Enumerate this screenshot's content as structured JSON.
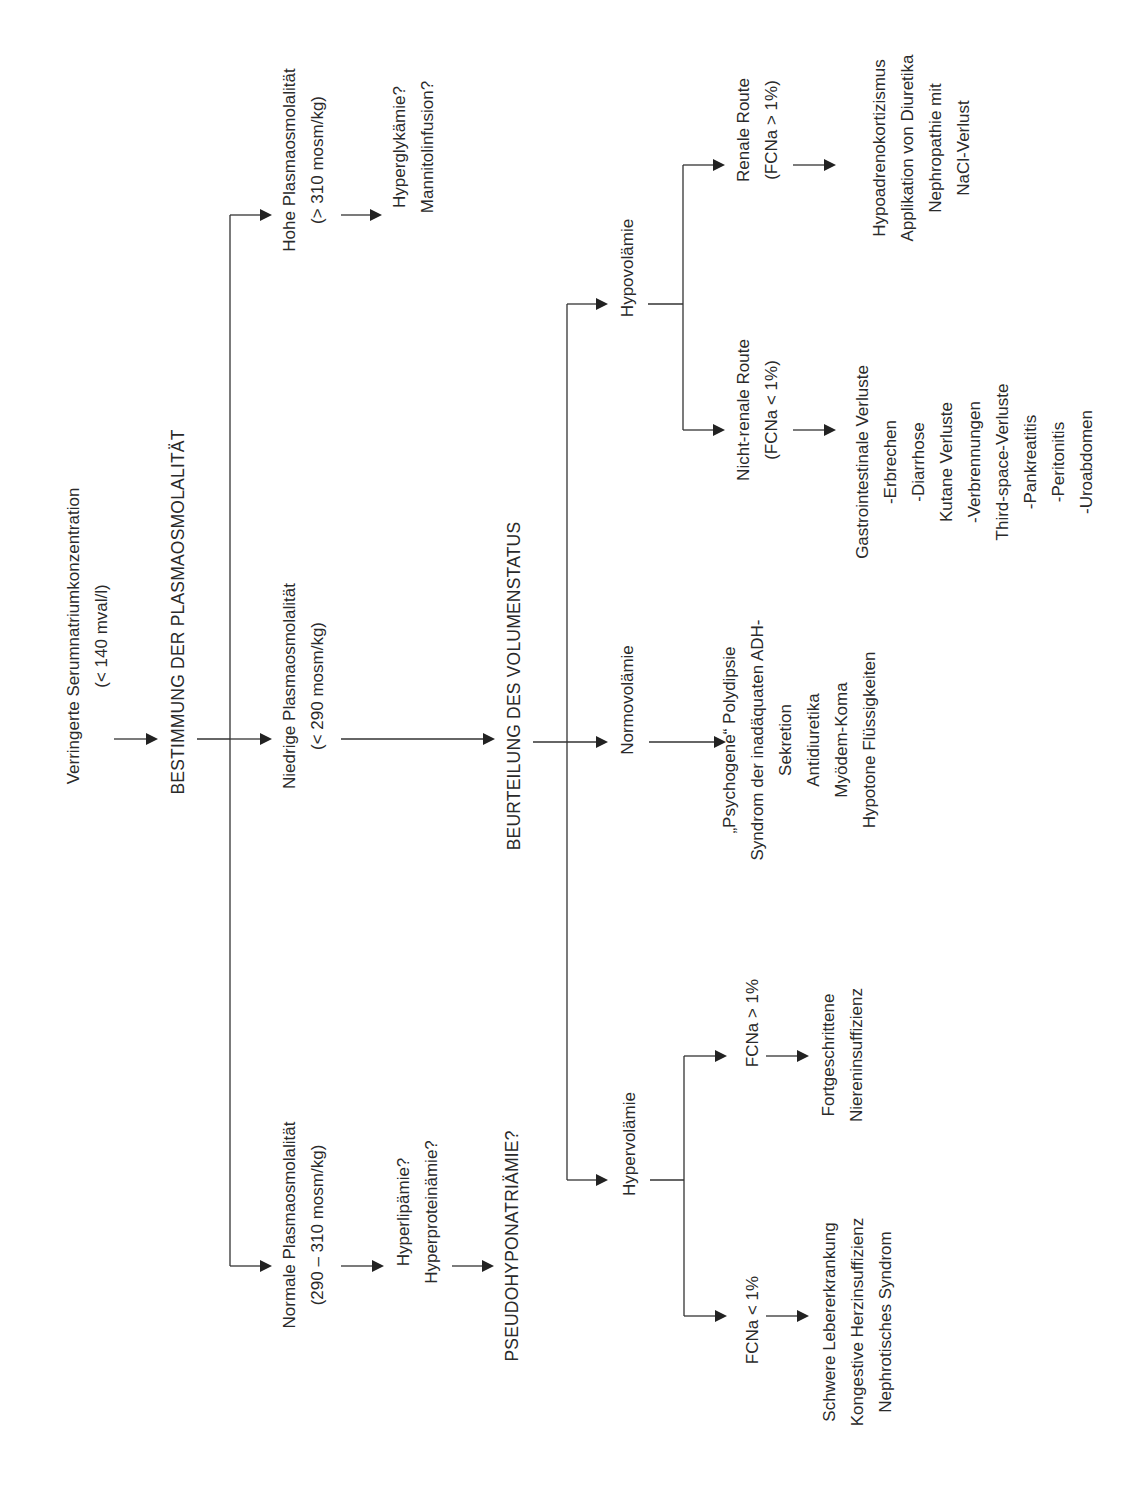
{
  "diagram": {
    "orientation": "rotated-90-ccw",
    "nodes": {
      "start": {
        "lines": [
          "Verringerte Serumnatriumkonzentration",
          "(< 140 mval/l)"
        ]
      },
      "step1": {
        "lines": [
          "BESTIMMUNG DER PLASMAOSMOLALITÄT"
        ]
      },
      "high_osm": {
        "lines": [
          "Hohe Plasmaosmolalität",
          "(> 310 mosm/kg)"
        ]
      },
      "high_osm_causes": {
        "lines": [
          "Hyperglykämie?",
          "Mannitolinfusion?"
        ]
      },
      "low_osm": {
        "lines": [
          "Niedrige Plasmaosmolalität",
          "(< 290 mosm/kg)"
        ]
      },
      "normal_osm": {
        "lines": [
          "Normale Plasmaosmolalität",
          "(290 – 310 mosm/kg)"
        ]
      },
      "normal_osm_causes": {
        "lines": [
          "Hyperlipämie?",
          "Hyperproteinämie?"
        ]
      },
      "pseudo": {
        "lines": [
          "PSEUDOHYPONATRIÄMIE?"
        ]
      },
      "step2": {
        "lines": [
          "BEURTEILUNG DES VOLUMENSTATUS"
        ]
      },
      "hypovolemia": {
        "lines": [
          "Hypovolämie"
        ]
      },
      "normovolemia": {
        "lines": [
          "Normovolämie"
        ]
      },
      "hypervolemia": {
        "lines": [
          "Hypervolämie"
        ]
      },
      "renal_route": {
        "lines": [
          "Renale Route",
          "(FCNa > 1%)"
        ]
      },
      "renal_route_causes": {
        "lines": [
          "Hypoadrenokortizismus",
          "Applikation von Diuretika",
          "Nephropathie mit",
          "NaCl-Verlust"
        ]
      },
      "nonrenal_route": {
        "lines": [
          "Nicht-renale Route",
          "(FCNa < 1%)"
        ]
      },
      "nonrenal_route_causes": {
        "lines": [
          "Gastrointestinale Verluste",
          "-Erbrechen",
          "-Diarrhose",
          "Kutane Verluste",
          "-Verbrennungen",
          "Third-space-Verluste",
          "-Pankreatitis",
          "-Peritonitis",
          "-Uroabdomen"
        ]
      },
      "normovolemia_causes": {
        "lines": [
          "„Psychogene“ Polydipsie",
          "Syndrom der inadäquaten ADH-",
          "Sekretion",
          "Antidiuretika",
          "Myödem-Koma",
          "Hypotone Flüssigkeiten"
        ]
      },
      "fcna_high": {
        "lines": [
          "FCNa > 1%"
        ]
      },
      "fcna_high_causes": {
        "lines": [
          "Fortgeschrittene",
          "Niereninsuffizienz"
        ]
      },
      "fcna_low": {
        "lines": [
          "FCNa < 1%"
        ]
      },
      "fcna_low_causes": {
        "lines": [
          "Schwere Lebererkrankung",
          "Kongestive Herzinsuffizienz",
          "Nephrotisches Syndrom"
        ]
      }
    },
    "edges": [
      [
        "start",
        "step1"
      ],
      [
        "step1",
        "high_osm"
      ],
      [
        "step1",
        "low_osm"
      ],
      [
        "step1",
        "normal_osm"
      ],
      [
        "high_osm",
        "high_osm_causes"
      ],
      [
        "normal_osm",
        "normal_osm_causes"
      ],
      [
        "normal_osm_causes",
        "pseudo"
      ],
      [
        "low_osm",
        "step2"
      ],
      [
        "step2",
        "hypovolemia"
      ],
      [
        "step2",
        "normovolemia"
      ],
      [
        "step2",
        "hypervolemia"
      ],
      [
        "hypovolemia",
        "renal_route"
      ],
      [
        "hypovolemia",
        "nonrenal_route"
      ],
      [
        "renal_route",
        "renal_route_causes"
      ],
      [
        "nonrenal_route",
        "nonrenal_route_causes"
      ],
      [
        "normovolemia",
        "normovolemia_causes"
      ],
      [
        "hypervolemia",
        "fcna_high"
      ],
      [
        "hypervolemia",
        "fcna_low"
      ],
      [
        "fcna_high",
        "fcna_high_causes"
      ],
      [
        "fcna_low",
        "fcna_low_causes"
      ]
    ],
    "colors": {
      "text": "#2a2a2a",
      "line": "#333333",
      "background": "#ffffff"
    }
  }
}
